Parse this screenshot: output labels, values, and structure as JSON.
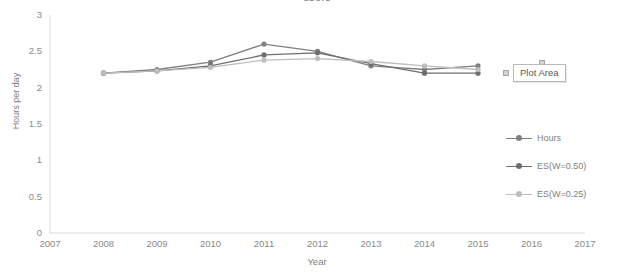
{
  "chart_data": {
    "type": "line",
    "title": "users",
    "xlabel": "Year",
    "ylabel": "Hours per day",
    "x": [
      2008,
      2009,
      2010,
      2011,
      2012,
      2013,
      2014,
      2015
    ],
    "xticks": [
      "2007",
      "2008",
      "2009",
      "2010",
      "2011",
      "2012",
      "2013",
      "2014",
      "2015",
      "2016",
      "2017"
    ],
    "yticks": [
      "0",
      "0.5",
      "1",
      "1.5",
      "2",
      "2.5",
      "3"
    ],
    "xlim": [
      2007,
      2017
    ],
    "ylim": [
      0,
      3
    ],
    "grid": false,
    "legend_position": "right",
    "series": [
      {
        "name": "Hours",
        "color": "#808080",
        "values": [
          2.2,
          2.25,
          2.35,
          2.6,
          2.5,
          2.3,
          2.25,
          2.3
        ]
      },
      {
        "name": "ES(W=0.50)",
        "color": "#6e6e6e",
        "values": [
          2.2,
          2.23,
          2.3,
          2.45,
          2.48,
          2.33,
          2.2,
          2.2
        ]
      },
      {
        "name": "ES(W=0.25)",
        "color": "#bdbdbd",
        "values": [
          2.2,
          2.23,
          2.28,
          2.38,
          2.4,
          2.36,
          2.3,
          2.25
        ]
      }
    ]
  },
  "annotations": {
    "plot_area_tooltip": "Plot Area"
  },
  "axis": {
    "line_color": "#d9d9d9"
  }
}
